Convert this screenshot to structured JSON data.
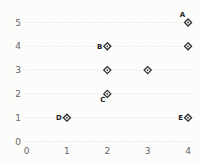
{
  "chart_data": {
    "type": "scatter",
    "title": "",
    "xlabel": "",
    "ylabel": "",
    "xlim": [
      0,
      4
    ],
    "ylim": [
      0,
      5
    ],
    "x_ticks": [
      "0",
      "1",
      "2",
      "3",
      "4"
    ],
    "y_ticks": [
      "0",
      "1",
      "2",
      "3",
      "4",
      "5"
    ],
    "grid": "horizontal dotted gridline at each y tick, no axis spines, no legend",
    "legend": "none",
    "marker": "open-diamond-with-center-dot",
    "points": [
      {
        "x": 4,
        "y": 5,
        "label": "A",
        "label_pos": "above-left"
      },
      {
        "x": 2,
        "y": 4,
        "label": "B",
        "label_pos": "left"
      },
      {
        "x": 4,
        "y": 4,
        "label": "",
        "label_pos": ""
      },
      {
        "x": 2,
        "y": 3,
        "label": "",
        "label_pos": ""
      },
      {
        "x": 3,
        "y": 3,
        "label": "",
        "label_pos": ""
      },
      {
        "x": 2,
        "y": 2,
        "label": "C",
        "label_pos": "below-left"
      },
      {
        "x": 1,
        "y": 1,
        "label": "D",
        "label_pos": "left"
      },
      {
        "x": 4,
        "y": 1,
        "label": "E",
        "label_pos": "left"
      }
    ],
    "colors": {
      "background": "#fcfcfb",
      "marker_stroke": "#2d2d2d",
      "marker_fill": "#ffffff",
      "grid": "#cfcfcd",
      "tick_text": "#666666",
      "point_label_text": "#1f1f1f"
    }
  }
}
